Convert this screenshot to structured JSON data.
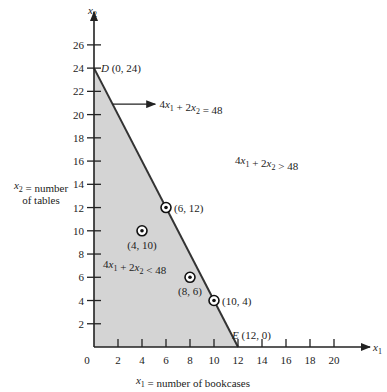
{
  "chart_data": {
    "type": "line",
    "title": "",
    "xlabel": "x1 = number of bookcases",
    "ylabel_line1": "x2 = number",
    "ylabel_line2": "of tables",
    "x_axis_symbol": "x1",
    "y_axis_symbol": "x2",
    "xlim": [
      0,
      22
    ],
    "ylim": [
      0,
      28
    ],
    "x_ticks": [
      2,
      4,
      6,
      8,
      10,
      12,
      14,
      16,
      18,
      20
    ],
    "y_ticks": [
      2,
      4,
      6,
      8,
      10,
      12,
      14,
      16,
      18,
      20,
      22,
      24,
      26
    ],
    "origin_label": "0",
    "grid": false,
    "constraint_line": {
      "label": "4x1 + 2x2 = 48",
      "from": [
        0,
        24
      ],
      "to": [
        12,
        0
      ]
    },
    "feasible_region": {
      "label": "4x1 + 2x2 < 48",
      "vertices": [
        [
          0,
          0
        ],
        [
          0,
          24
        ],
        [
          12,
          0
        ]
      ],
      "fill": "#d4d4d4"
    },
    "infeasible_region_label": "4x1 + 2x2 > 48",
    "vertices_labeled": [
      {
        "name": "D",
        "x": 0,
        "y": 24,
        "label": "D (0, 24)"
      },
      {
        "name": "E",
        "x": 12,
        "y": 0,
        "label": "E (12, 0)"
      }
    ],
    "points": [
      {
        "x": 6,
        "y": 12,
        "label": "(6, 12)"
      },
      {
        "x": 4,
        "y": 10,
        "label": "(4, 10)"
      },
      {
        "x": 8,
        "y": 6,
        "label": "(8, 6)"
      },
      {
        "x": 10,
        "y": 4,
        "label": "(10, 4)"
      }
    ]
  }
}
